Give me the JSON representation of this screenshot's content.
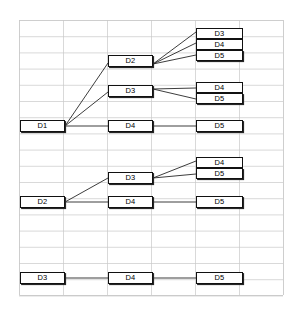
{
  "diagram": {
    "type": "tree-hierarchy",
    "title": "",
    "background": "#ffffff",
    "box_fill": "#ffffff",
    "box_stroke": "#111111",
    "box_shadow": "#262626",
    "edge_color": "#1a1a1a",
    "grid_color": "#c8c8c8",
    "grid": {
      "left": 19,
      "top": 20,
      "right": 283,
      "bottom": 295,
      "col_step": 44,
      "row_step": 16.2,
      "columns": 6,
      "rows": 17
    },
    "nodes": [
      {
        "id": "n1",
        "label": "D3",
        "x": 196,
        "y": 28,
        "w": 47,
        "h": 11,
        "group": "stack-top"
      },
      {
        "id": "n2",
        "label": "D4",
        "x": 196,
        "y": 39,
        "w": 47,
        "h": 11,
        "group": "stack-mid"
      },
      {
        "id": "n3",
        "label": "D5",
        "x": 196,
        "y": 50,
        "w": 47,
        "h": 11,
        "group": "stack-bottom"
      },
      {
        "id": "n4",
        "label": "D2",
        "x": 108,
        "y": 55,
        "w": 45,
        "h": 12,
        "group": "single"
      },
      {
        "id": "n5",
        "label": "D3",
        "x": 108,
        "y": 85,
        "w": 45,
        "h": 12,
        "group": "single"
      },
      {
        "id": "n6",
        "label": "D4",
        "x": 196,
        "y": 82,
        "w": 47,
        "h": 11,
        "group": "stack-top"
      },
      {
        "id": "n7",
        "label": "D5",
        "x": 196,
        "y": 93,
        "w": 47,
        "h": 11,
        "group": "stack-bottom"
      },
      {
        "id": "n8",
        "label": "D1",
        "x": 20,
        "y": 120,
        "w": 45,
        "h": 12,
        "group": "single"
      },
      {
        "id": "n9",
        "label": "D4",
        "x": 108,
        "y": 120,
        "w": 45,
        "h": 12,
        "group": "single"
      },
      {
        "id": "n10",
        "label": "D5",
        "x": 196,
        "y": 120,
        "w": 47,
        "h": 12,
        "group": "single"
      },
      {
        "id": "n11",
        "label": "D4",
        "x": 196,
        "y": 157,
        "w": 47,
        "h": 11,
        "group": "stack-top"
      },
      {
        "id": "n12",
        "label": "D5",
        "x": 196,
        "y": 168,
        "w": 47,
        "h": 11,
        "group": "stack-bottom"
      },
      {
        "id": "n13",
        "label": "D3",
        "x": 108,
        "y": 172,
        "w": 45,
        "h": 12,
        "group": "single"
      },
      {
        "id": "n14",
        "label": "D2",
        "x": 20,
        "y": 196,
        "w": 45,
        "h": 12,
        "group": "single"
      },
      {
        "id": "n15",
        "label": "D4",
        "x": 108,
        "y": 196,
        "w": 45,
        "h": 12,
        "group": "single"
      },
      {
        "id": "n16",
        "label": "D5",
        "x": 196,
        "y": 196,
        "w": 47,
        "h": 12,
        "group": "single"
      },
      {
        "id": "n17",
        "label": "D3",
        "x": 20,
        "y": 272,
        "w": 45,
        "h": 12,
        "group": "single"
      },
      {
        "id": "n18",
        "label": "D4",
        "x": 108,
        "y": 272,
        "w": 45,
        "h": 12,
        "group": "single"
      },
      {
        "id": "n19",
        "label": "D5",
        "x": 196,
        "y": 272,
        "w": 47,
        "h": 12,
        "group": "single"
      }
    ],
    "edges": [
      {
        "from": "n8",
        "to": "n4",
        "x1": 65,
        "y1": 126,
        "x2": 108,
        "y2": 63
      },
      {
        "from": "n8",
        "to": "n5",
        "x1": 65,
        "y1": 126,
        "x2": 108,
        "y2": 92
      },
      {
        "from": "n8",
        "to": "n9",
        "x1": 65,
        "y1": 126,
        "x2": 108,
        "y2": 126
      },
      {
        "from": "n4",
        "to": "n1",
        "x1": 153,
        "y1": 64,
        "x2": 196,
        "y2": 32
      },
      {
        "from": "n4",
        "to": "n2",
        "x1": 153,
        "y1": 64,
        "x2": 196,
        "y2": 43
      },
      {
        "from": "n4",
        "to": "n3",
        "x1": 153,
        "y1": 64,
        "x2": 196,
        "y2": 55
      },
      {
        "from": "n5",
        "to": "n6",
        "x1": 153,
        "y1": 89,
        "x2": 196,
        "y2": 88
      },
      {
        "from": "n5",
        "to": "n7",
        "x1": 153,
        "y1": 89,
        "x2": 196,
        "y2": 99
      },
      {
        "from": "n9",
        "to": "n10",
        "x1": 153,
        "y1": 126,
        "x2": 196,
        "y2": 126
      },
      {
        "from": "n14",
        "to": "n13",
        "x1": 65,
        "y1": 202,
        "x2": 108,
        "y2": 178
      },
      {
        "from": "n14",
        "to": "n15",
        "x1": 65,
        "y1": 202,
        "x2": 108,
        "y2": 202
      },
      {
        "from": "n13",
        "to": "n11",
        "x1": 153,
        "y1": 178,
        "x2": 196,
        "y2": 161
      },
      {
        "from": "n13",
        "to": "n12",
        "x1": 153,
        "y1": 178,
        "x2": 196,
        "y2": 174
      },
      {
        "from": "n15",
        "to": "n16",
        "x1": 153,
        "y1": 202,
        "x2": 196,
        "y2": 202
      },
      {
        "from": "n17",
        "to": "n18",
        "x1": 65,
        "y1": 278,
        "x2": 108,
        "y2": 278
      },
      {
        "from": "n18",
        "to": "n19",
        "x1": 153,
        "y1": 278,
        "x2": 196,
        "y2": 278
      }
    ]
  }
}
